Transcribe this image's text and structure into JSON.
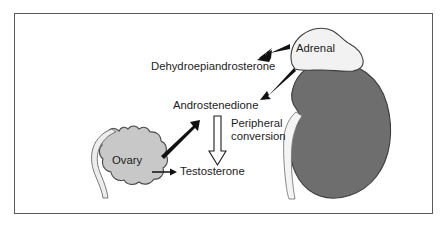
{
  "figure": {
    "background_color": "#ffffff",
    "border_color": "#5a5a5e"
  },
  "colors": {
    "kidney_fill": "#6e6e6e",
    "kidney_stroke": "#3d3d3d",
    "adrenal_fill": "#f2f2f2",
    "adrenal_stroke": "#3d3d3d",
    "ovary_fill": "#c8c8c8",
    "ovary_stroke": "#4a4a4a",
    "tube_fill": "#ededed",
    "tube_stroke": "#6b6b6b",
    "arrow_solid": "#111111",
    "arrow_hollow_fill": "#ffffff",
    "arrow_hollow_stroke": "#1c1c1c",
    "text": "#1c1c1c"
  },
  "labels": {
    "dehydroepiandrosterone": "Dehydroepiandrosterone",
    "androstenedione": "Androstenedione",
    "testosterone": "Testosterone",
    "peripheral_line1": "Peripheral",
    "peripheral_line2": "conversion",
    "adrenal": "Adrenal",
    "ovary": "Ovary"
  },
  "organs": [
    {
      "name": "adrenal-gland",
      "label": "Adrenal",
      "fill": "#f2f2f2"
    },
    {
      "name": "kidney",
      "label": "",
      "fill": "#6e6e6e"
    },
    {
      "name": "ovary",
      "label": "Ovary",
      "fill": "#c8c8c8"
    },
    {
      "name": "fallopian-tube",
      "label": "",
      "fill": "#ededed"
    }
  ],
  "arrows": [
    {
      "name": "adrenal-to-dehydroepiandrosterone",
      "from": "Adrenal",
      "to": "Dehydroepiandrosterone",
      "style": "thick-solid",
      "color": "#111111"
    },
    {
      "name": "adrenal-to-androstenedione",
      "from": "Adrenal",
      "to": "Androstenedione",
      "style": "medium-solid",
      "color": "#111111"
    },
    {
      "name": "ovary-to-androstenedione",
      "from": "Ovary",
      "to": "Androstenedione",
      "style": "thick-solid",
      "color": "#111111"
    },
    {
      "name": "ovary-to-testosterone",
      "from": "Ovary",
      "to": "Testosterone",
      "style": "thin-solid",
      "color": "#111111"
    },
    {
      "name": "androstenedione-to-testosterone",
      "from": "Androstenedione",
      "to": "Testosterone",
      "style": "hollow-outline",
      "color": "#ffffff",
      "annotation": "Peripheral conversion"
    }
  ]
}
